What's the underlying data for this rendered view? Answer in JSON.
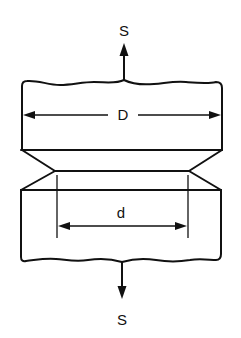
{
  "figure": {
    "labels": {
      "top_force": "S",
      "bottom_force": "S",
      "outer_diameter": "D",
      "notch_diameter": "d"
    },
    "colors": {
      "line": "#111111",
      "background": "#ffffff"
    }
  }
}
